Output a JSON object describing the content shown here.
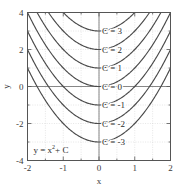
{
  "chart_data": {
    "type": "line",
    "title": "",
    "annotation_equation": "y = x",
    "annotation_equation_sup": "2",
    "annotation_equation_tail": " + C",
    "xlabel": "x",
    "ylabel": "y",
    "xlim": [
      -2,
      2
    ],
    "ylim": [
      -4,
      4
    ],
    "xticks": [
      -2,
      -1,
      0,
      1,
      2
    ],
    "xtick_labels": [
      "-2",
      "-1",
      "0",
      "1",
      "2"
    ],
    "yticks": [
      -4,
      -2,
      0,
      2,
      4
    ],
    "ytick_labels": [
      "-4",
      "-2",
      "0",
      "2",
      "4"
    ],
    "grid": true,
    "legend": "inline-curve-labels",
    "series": [
      {
        "name": "C = 3",
        "C": 3,
        "label": "C = 3",
        "x": [
          -2,
          -1.75,
          -1.5,
          -1.25,
          -1,
          -0.75,
          -0.5,
          -0.25,
          0,
          0.25,
          0.5,
          0.75,
          1,
          1.25,
          1.5,
          1.75,
          2
        ],
        "y": [
          7,
          6.0625,
          5.25,
          4.5625,
          4,
          3.5625,
          3.25,
          3.0625,
          3,
          3.0625,
          3.25,
          3.5625,
          4,
          4.5625,
          5.25,
          6.0625,
          7
        ]
      },
      {
        "name": "C = 2",
        "C": 2,
        "label": "C = 2",
        "x": [
          -2,
          -1.75,
          -1.5,
          -1.25,
          -1,
          -0.75,
          -0.5,
          -0.25,
          0,
          0.25,
          0.5,
          0.75,
          1,
          1.25,
          1.5,
          1.75,
          2
        ],
        "y": [
          6,
          5.0625,
          4.25,
          3.5625,
          3,
          2.5625,
          2.25,
          2.0625,
          2,
          2.0625,
          2.25,
          2.5625,
          3,
          3.5625,
          4.25,
          5.0625,
          6
        ]
      },
      {
        "name": "C = 1",
        "C": 1,
        "label": "C = 1",
        "x": [
          -2,
          -1.75,
          -1.5,
          -1.25,
          -1,
          -0.75,
          -0.5,
          -0.25,
          0,
          0.25,
          0.5,
          0.75,
          1,
          1.25,
          1.5,
          1.75,
          2
        ],
        "y": [
          5,
          4.0625,
          3.25,
          2.5625,
          2,
          1.5625,
          1.25,
          1.0625,
          1,
          1.0625,
          1.25,
          1.5625,
          2,
          2.5625,
          3.25,
          4.0625,
          5
        ]
      },
      {
        "name": "C = 0",
        "C": 0,
        "label": "C = 0",
        "x": [
          -2,
          -1.75,
          -1.5,
          -1.25,
          -1,
          -0.75,
          -0.5,
          -0.25,
          0,
          0.25,
          0.5,
          0.75,
          1,
          1.25,
          1.5,
          1.75,
          2
        ],
        "y": [
          4,
          3.0625,
          2.25,
          1.5625,
          1,
          0.5625,
          0.25,
          0.0625,
          0,
          0.0625,
          0.25,
          0.5625,
          1,
          1.5625,
          2.25,
          3.0625,
          4
        ]
      },
      {
        "name": "C = -1",
        "C": -1,
        "label": "C = -1",
        "x": [
          -2,
          -1.75,
          -1.5,
          -1.25,
          -1,
          -0.75,
          -0.5,
          -0.25,
          0,
          0.25,
          0.5,
          0.75,
          1,
          1.25,
          1.5,
          1.75,
          2
        ],
        "y": [
          3,
          2.0625,
          1.25,
          0.5625,
          0,
          -0.4375,
          -0.75,
          -0.9375,
          -1,
          -0.9375,
          -0.75,
          -0.4375,
          0,
          0.5625,
          1.25,
          2.0625,
          3
        ]
      },
      {
        "name": "C = -2",
        "C": -2,
        "label": "C = -2",
        "x": [
          -2,
          -1.75,
          -1.5,
          -1.25,
          -1,
          -0.75,
          -0.5,
          -0.25,
          0,
          0.25,
          0.5,
          0.75,
          1,
          1.25,
          1.5,
          1.75,
          2
        ],
        "y": [
          2,
          1.0625,
          0.25,
          -0.4375,
          -1,
          -1.4375,
          -1.75,
          -1.9375,
          -2,
          -1.9375,
          -1.75,
          -1.4375,
          -1,
          -0.4375,
          0.25,
          1.0625,
          2
        ]
      },
      {
        "name": "C = -3",
        "C": -3,
        "label": "C = -3",
        "x": [
          -2,
          -1.75,
          -1.5,
          -1.25,
          -1,
          -0.75,
          -0.5,
          -0.25,
          0,
          0.25,
          0.5,
          0.75,
          1,
          1.25,
          1.5,
          1.75,
          2
        ],
        "y": [
          1,
          0.0625,
          -0.75,
          -1.4375,
          -2,
          -2.4375,
          -2.75,
          -2.9375,
          -3,
          -2.9375,
          -2.75,
          -2.4375,
          -2,
          -1.4375,
          -0.75,
          0.0625,
          1
        ]
      }
    ],
    "colors": {
      "curve": "#4a4a4a",
      "grid": "#cccccc",
      "axis": "#6b6b6b",
      "frame": "#555555",
      "text": "#2b2b2b",
      "background": "#ffffff"
    }
  }
}
